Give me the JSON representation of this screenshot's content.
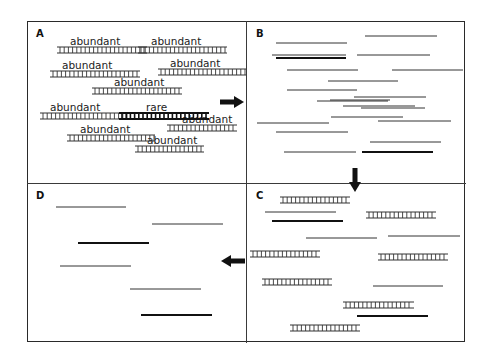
{
  "figure": {
    "type": "dsn-normalization-schematic",
    "colors": {
      "strand": "#333333",
      "rare_strand": "#111111",
      "frame": "#2a2a2a",
      "arrow": "#111111"
    },
    "panels": [
      {
        "id": "A",
        "label": "A",
        "description": "double-stranded molecules, mostly abundant, one rare",
        "molecules": [
          {
            "kind": "ds",
            "label": "abundant",
            "x1": 57,
            "x2": 147,
            "y": 47,
            "lx": 70,
            "ly": 36
          },
          {
            "kind": "ds",
            "label": "abundant",
            "x1": 138,
            "x2": 227,
            "y": 47,
            "lx": 151,
            "ly": 36
          },
          {
            "kind": "ds",
            "label": "abundant",
            "x1": 50,
            "x2": 140,
            "y": 71,
            "lx": 62,
            "ly": 60
          },
          {
            "kind": "ds",
            "label": "abundant",
            "x1": 158,
            "x2": 246,
            "y": 69,
            "lx": 170,
            "ly": 58
          },
          {
            "kind": "ds",
            "label": "abundant",
            "x1": 92,
            "x2": 182,
            "y": 88,
            "lx": 114,
            "ly": 77
          },
          {
            "kind": "ds",
            "label": "abundant",
            "x1": 40,
            "x2": 130,
            "y": 113,
            "lx": 50,
            "ly": 102
          },
          {
            "kind": "ds-rare",
            "label": "rare",
            "x1": 119,
            "x2": 209,
            "y": 113,
            "lx": 146,
            "ly": 102
          },
          {
            "kind": "ds",
            "label": "abundant",
            "x1": 167,
            "x2": 237,
            "y": 125,
            "lx": 182,
            "ly": 114
          },
          {
            "kind": "ds",
            "label": "abundant",
            "x1": 67,
            "x2": 155,
            "y": 135,
            "lx": 80,
            "ly": 124
          },
          {
            "kind": "ds",
            "label": "abundant",
            "x1": 135,
            "x2": 204,
            "y": 146,
            "lx": 147,
            "ly": 135
          }
        ]
      },
      {
        "id": "B",
        "label": "B",
        "description": "denatured single strands",
        "strands": [
          {
            "x1": 365,
            "x2": 437,
            "y": 36,
            "bold": false
          },
          {
            "x1": 276,
            "x2": 347,
            "y": 43,
            "bold": false
          },
          {
            "x1": 272,
            "x2": 346,
            "y": 55,
            "bold": false
          },
          {
            "x1": 276,
            "x2": 346,
            "y": 58,
            "bold": true
          },
          {
            "x1": 357,
            "x2": 430,
            "y": 55,
            "bold": false
          },
          {
            "x1": 287,
            "x2": 358,
            "y": 70,
            "bold": false
          },
          {
            "x1": 392,
            "x2": 463,
            "y": 70,
            "bold": false
          },
          {
            "x1": 328,
            "x2": 398,
            "y": 81,
            "bold": false
          },
          {
            "x1": 287,
            "x2": 357,
            "y": 90,
            "bold": false
          },
          {
            "x1": 354,
            "x2": 426,
            "y": 97,
            "bold": false
          },
          {
            "x1": 317,
            "x2": 388,
            "y": 101,
            "bold": false
          },
          {
            "x1": 343,
            "x2": 415,
            "y": 106,
            "bold": false
          },
          {
            "x1": 330,
            "x2": 390,
            "y": 100,
            "bold": false
          },
          {
            "x1": 361,
            "x2": 425,
            "y": 108,
            "bold": false
          },
          {
            "x1": 331,
            "x2": 403,
            "y": 117,
            "bold": false
          },
          {
            "x1": 378,
            "x2": 451,
            "y": 121,
            "bold": false
          },
          {
            "x1": 257,
            "x2": 329,
            "y": 123,
            "bold": false
          },
          {
            "x1": 276,
            "x2": 348,
            "y": 132,
            "bold": false
          },
          {
            "x1": 370,
            "x2": 441,
            "y": 142,
            "bold": false
          },
          {
            "x1": 284,
            "x2": 356,
            "y": 152,
            "bold": false
          },
          {
            "x1": 362,
            "x2": 433,
            "y": 152,
            "bold": true
          }
        ]
      },
      {
        "id": "C",
        "label": "C",
        "description": "partial reannealing: abundant re-form duplexes, rare remains single",
        "molecules": [
          {
            "kind": "ds",
            "x1": 280,
            "x2": 350,
            "y": 197
          },
          {
            "kind": "ss",
            "x1": 265,
            "x2": 336,
            "y": 212,
            "bold": false
          },
          {
            "kind": "ss",
            "x1": 272,
            "x2": 343,
            "y": 221,
            "bold": true
          },
          {
            "kind": "ds",
            "x1": 366,
            "x2": 436,
            "y": 212
          },
          {
            "kind": "ss",
            "x1": 306,
            "x2": 377,
            "y": 238,
            "bold": false
          },
          {
            "kind": "ss",
            "x1": 388,
            "x2": 460,
            "y": 236,
            "bold": false
          },
          {
            "kind": "ds",
            "x1": 250,
            "x2": 320,
            "y": 251
          },
          {
            "kind": "ds",
            "x1": 378,
            "x2": 448,
            "y": 254
          },
          {
            "kind": "ds",
            "x1": 262,
            "x2": 332,
            "y": 279
          },
          {
            "kind": "ss",
            "x1": 373,
            "x2": 443,
            "y": 286,
            "bold": false
          },
          {
            "kind": "ds",
            "x1": 343,
            "x2": 414,
            "y": 302
          },
          {
            "kind": "ss",
            "x1": 357,
            "x2": 428,
            "y": 316,
            "bold": true
          },
          {
            "kind": "ds",
            "x1": 290,
            "x2": 360,
            "y": 325
          }
        ]
      },
      {
        "id": "D",
        "label": "D",
        "description": "remaining normalized single strands after removal of duplexes",
        "strands": [
          {
            "x1": 56,
            "x2": 126,
            "y": 207,
            "bold": false
          },
          {
            "x1": 152,
            "x2": 223,
            "y": 224,
            "bold": false
          },
          {
            "x1": 78,
            "x2": 149,
            "y": 243,
            "bold": true
          },
          {
            "x1": 60,
            "x2": 131,
            "y": 266,
            "bold": false
          },
          {
            "x1": 130,
            "x2": 201,
            "y": 289,
            "bold": false
          },
          {
            "x1": 141,
            "x2": 212,
            "y": 315,
            "bold": true
          }
        ]
      }
    ],
    "arrows": [
      {
        "id": "arrow-a-to-b",
        "direction": "right",
        "x": 234,
        "y": 102
      },
      {
        "id": "arrow-b-to-c",
        "direction": "down",
        "x": 355,
        "y": 182
      },
      {
        "id": "arrow-c-to-d",
        "direction": "left",
        "x": 245,
        "y": 261
      }
    ]
  }
}
